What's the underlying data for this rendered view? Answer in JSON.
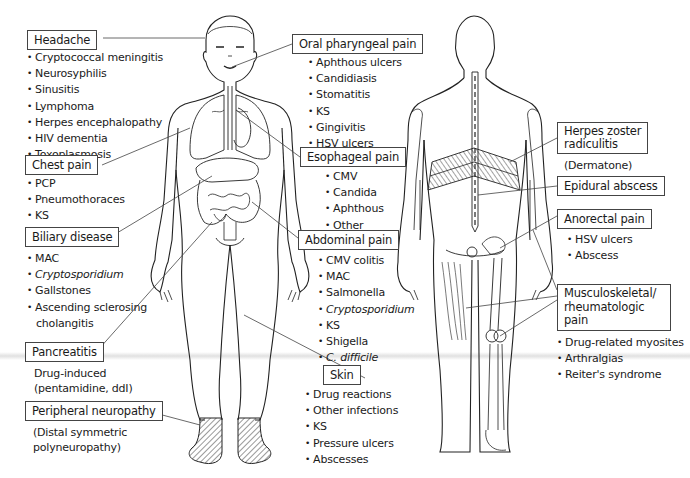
{
  "diagram": {
    "figures": [
      "anterior-body",
      "posterior-body"
    ]
  },
  "headache": {
    "title": "Headache",
    "items": [
      "Cryptococcal meningitis",
      "Neurosyphilis",
      "Sinusitis",
      "Lymphoma",
      "Herpes encephalopathy",
      "HIV dementia",
      "Toxoplasmosis"
    ]
  },
  "chest_pain": {
    "title": "Chest pain",
    "items": [
      "PCP",
      "Pneumothoraces",
      "KS"
    ]
  },
  "biliary": {
    "title": "Biliary disease",
    "items": [
      "MAC",
      "Cryptosporidium",
      "Gallstones",
      "Ascending sclerosing",
      "cholangitis"
    ],
    "italic": [
      false,
      true,
      false,
      false,
      false
    ]
  },
  "pancreatitis": {
    "title": "Pancreatitis",
    "note": [
      "Drug-induced",
      "(pentamidine, ddI)"
    ]
  },
  "neuropathy": {
    "title": "Peripheral neuropathy",
    "note": [
      "(Distal symmetric",
      "polyneuropathy)"
    ]
  },
  "oral": {
    "title": "Oral pharyngeal pain",
    "items": [
      "Aphthous ulcers",
      "Candidiasis",
      "Stomatitis",
      "KS",
      "Gingivitis",
      "HSV ulcers"
    ]
  },
  "esophageal": {
    "title": "Esophageal pain",
    "items": [
      "CMV",
      "Candida",
      "Aphthous",
      "Other"
    ]
  },
  "abdominal": {
    "title": "Abdominal pain",
    "items": [
      "CMV colitis",
      "MAC",
      "Salmonella",
      "Cryptosporidium",
      "KS",
      "Shigella",
      "C. difficile"
    ],
    "italic": [
      false,
      false,
      false,
      true,
      false,
      false,
      true
    ]
  },
  "skin": {
    "title": "Skin",
    "items": [
      "Drug reactions",
      "Other infections",
      "KS",
      "Pressure ulcers",
      "Abscesses"
    ]
  },
  "herpes": {
    "title_line1": "Herpes zoster",
    "title_line2": "radiculitis",
    "note": "(Dermatone)"
  },
  "epidural": {
    "title": "Epidural abscess"
  },
  "anorectal": {
    "title": "Anorectal pain",
    "items": [
      "HSV ulcers",
      "Abscess"
    ]
  },
  "musculo": {
    "title_line1": "Musculoskeletal/",
    "title_line2": "rheumatologic",
    "title_line3": "pain",
    "items": [
      "Drug-related myosites",
      "Arthralgias",
      "Reiter's syndrome"
    ]
  },
  "colors": {
    "line": "#222222",
    "leader": "#444444",
    "hatch": "#333333",
    "background": "#ffffff"
  }
}
